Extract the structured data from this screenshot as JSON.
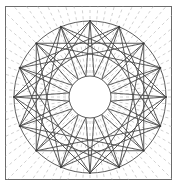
{
  "figure": {
    "canvas": {
      "width": 179,
      "height": 194,
      "background": "#ffffff"
    },
    "frame": {
      "label": "outer rectangular border",
      "x": 5.5,
      "y": 6.5,
      "width": 166,
      "height": 173,
      "stroke": "#6b6b6b",
      "stroke_width": 1,
      "fill": "#ffffff"
    },
    "center": {
      "x": 90,
      "y": 97
    },
    "outer_circle": {
      "label": "outer bounding circle",
      "radius": 76,
      "stroke": "#4a4a4a",
      "stroke_width": 0.9,
      "fill": "none"
    },
    "inner_circle": {
      "label": "central white hub circle",
      "radius": 21,
      "stroke": "#4a4a4a",
      "stroke_width": 0.9,
      "fill": "#ffffff"
    },
    "star": {
      "label": "sixteen-point star polygon",
      "points": 16,
      "step": 5,
      "outer_radius": 76,
      "inner_radius": 21,
      "rotation_deg": -90,
      "stroke": "#4a4a4a",
      "stroke_width": 0.9,
      "fill": "none"
    },
    "vertices": {
      "label": "star tip markers on outer circle",
      "count": 16,
      "radius": 76,
      "dot_radius": 1.1,
      "color": "#3a3a3a"
    },
    "rays": {
      "label": "light dashed radial rays",
      "count": 72,
      "inner_start_radius": 0,
      "outer_end_radius": 190,
      "stroke": "#bdbdbd",
      "stroke_width": 0.7,
      "dash_pattern": "3 3"
    },
    "colors": {
      "line_dark": "#4a4a4a",
      "frame": "#6b6b6b",
      "ray_gray": "#bdbdbd",
      "background": "#ffffff"
    }
  },
  "chart_data": {
    "type": "diagram",
    "symmetry_order": 16,
    "radii": {
      "outer": 76,
      "inner": 21
    },
    "elements": [
      {
        "name": "frame",
        "kind": "rectangle",
        "count": 1
      },
      {
        "name": "outer-circle",
        "kind": "circle",
        "count": 1
      },
      {
        "name": "inner-circle",
        "kind": "circle",
        "count": 1
      },
      {
        "name": "star-chords",
        "kind": "polygon",
        "count": 16
      },
      {
        "name": "radial-rays",
        "kind": "dashed-line",
        "count": 72
      },
      {
        "name": "vertex-dots",
        "kind": "point",
        "count": 16
      }
    ]
  }
}
